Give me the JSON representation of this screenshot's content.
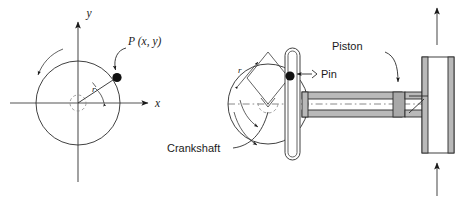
{
  "figure": {
    "background_color": "#ffffff",
    "line_color": "#2b2b2b",
    "metal_fill_color": "#b9b9b9",
    "piston_fill_color": "#a8a8a8"
  },
  "left_diagram": {
    "name": "crank circle in xy-plane",
    "axis_x_label": "x",
    "axis_y_label": "y",
    "point_label": "P (x, y)",
    "radius_label": "r",
    "angle_label": "",
    "rotation_arrow": "counter-clockwise"
  },
  "right_diagram": {
    "name": "slider crank assembly",
    "crankshaft_label": "Crankshaft",
    "pin_label": "Pin",
    "piston_label": "Piston",
    "radius_label": "r",
    "rotation_arrow": "counter-clockwise",
    "force_arrow_top": "up",
    "force_arrow_bottom": "up"
  }
}
